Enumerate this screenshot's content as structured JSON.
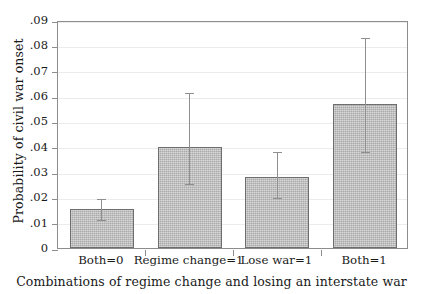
{
  "chart_data": {
    "type": "bar",
    "title": "",
    "xlabel": "Combinations of regime change and losing an interstate war",
    "ylabel": "Probability of civil war onset",
    "categories": [
      "Both=0",
      "Regime change=1",
      "Lose war=1",
      "Both=1"
    ],
    "values": [
      0.0155,
      0.0397,
      0.0282,
      0.057
    ],
    "error_low": [
      0.0115,
      0.0258,
      0.0205,
      0.0385
    ],
    "error_high": [
      0.0198,
      0.0616,
      0.0385,
      0.0834
    ],
    "ylim": [
      0,
      0.09
    ],
    "ytick_values": [
      0,
      0.01,
      0.02,
      0.03,
      0.04,
      0.05,
      0.06,
      0.07,
      0.08,
      0.09
    ],
    "ytick_labels": [
      "0",
      ".01",
      ".02",
      ".03",
      ".04",
      ".05",
      ".06",
      ".07",
      ".08",
      ".09"
    ],
    "grid": true,
    "legend": "none",
    "bar_color": "#b4b4b4",
    "bar_edge_color": "#6e6e6e",
    "error_bar_color": "#8f8f8f",
    "axis_color": "#8d8d8d",
    "grid_color": "#ececec"
  }
}
